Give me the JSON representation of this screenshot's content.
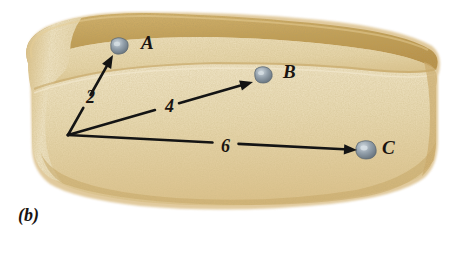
{
  "figure": {
    "caption": "(b)",
    "background_color": "#ffffff",
    "object": "loaf-of-bread",
    "colors": {
      "crust_dark": "#c09a4a",
      "crust_mid": "#d9bb7c",
      "crumb_light": "#f2e7c9",
      "crumb_mid": "#e8d7ae",
      "raisin": "#8e99a4",
      "raisin_highlight": "#c3ccd4",
      "arrow": "#141414",
      "text": "#1a1410"
    }
  },
  "points": [
    {
      "id": "A",
      "label": "A",
      "label_x": 141,
      "label_y": 33,
      "raisin_cx": 119,
      "raisin_cy": 46,
      "raisin_r": 8
    },
    {
      "id": "B",
      "label": "B",
      "label_x": 283,
      "label_y": 62,
      "raisin_cx": 263,
      "raisin_cy": 75,
      "raisin_r": 8
    },
    {
      "id": "C",
      "label": "C",
      "label_x": 382,
      "label_y": 138,
      "raisin_cx": 366,
      "raisin_cy": 150,
      "raisin_r": 9
    }
  ],
  "arrows": [
    {
      "id": "arrow-2",
      "value": "2",
      "to_point": "A",
      "label_x": 86,
      "label_y": 88,
      "x1": 68,
      "y1": 135,
      "x2": 113,
      "y2": 55,
      "gap_t1": 0.34,
      "gap_t2": 0.5
    },
    {
      "id": "arrow-4",
      "value": "4",
      "to_point": "B",
      "label_x": 165,
      "label_y": 97,
      "x1": 68,
      "y1": 135,
      "x2": 253,
      "y2": 82,
      "gap_t1": 0.47,
      "gap_t2": 0.6
    },
    {
      "id": "arrow-6",
      "value": "6",
      "to_point": "C",
      "label_x": 221,
      "label_y": 137,
      "x1": 68,
      "y1": 135,
      "x2": 357,
      "y2": 150,
      "gap_t1": 0.5,
      "gap_t2": 0.59
    }
  ],
  "chart_data": {
    "type": "scatter",
    "title": "(b)",
    "xlabel": "",
    "ylabel": "",
    "annotation": "Expanding-bread analogy: raisins A, B, C recede from a common origin with displacements proportional to distance.",
    "categories": [
      "A",
      "B",
      "C"
    ],
    "values": [
      2,
      4,
      6
    ],
    "series": [
      {
        "name": "distance",
        "values": [
          2,
          4,
          6
        ]
      }
    ]
  }
}
